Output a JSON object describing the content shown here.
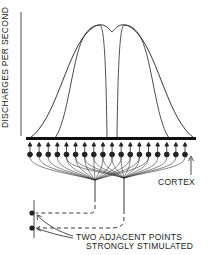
{
  "diagram": {
    "y_axis_label": "DISCHARGES PER SECOND",
    "cortex_label": "CORTEX",
    "stimulus_label_line1": "TWO ADJACENT POINTS",
    "stimulus_label_line2": "STRONGLY STIMULATED",
    "neuron_count": 18,
    "curves": [
      {
        "name": "left-response-curve",
        "description": "narrow curve peaking left of center"
      },
      {
        "name": "right-response-curve",
        "description": "narrow curve peaking right of center"
      },
      {
        "name": "combined-response-curve",
        "description": "broad summed curve with central dip"
      }
    ],
    "colors": {
      "ink": "#222222",
      "background": "#ffffff"
    }
  }
}
